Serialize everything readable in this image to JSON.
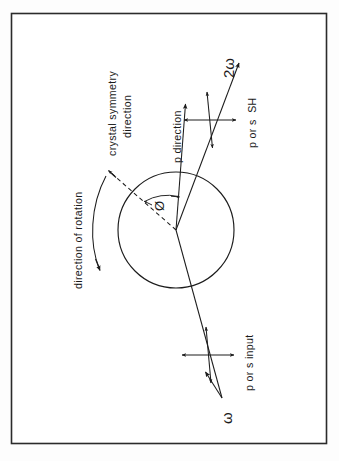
{
  "figure": {
    "border_color": "#2b2b2b",
    "ink_color": "#1c1c1c",
    "background_color": "#ffffff"
  },
  "labels": {
    "crystal_symmetry_line1": "crystal symmetry",
    "crystal_symmetry_line2": "direction",
    "p_direction": "p direction",
    "direction_of_rotation": "direction of rotation",
    "angle_symbol": "Ø",
    "output_beam_symbol": "2ω",
    "output_polarization": "p or s  SH",
    "input_beam_symbol": "ω",
    "input_polarization": "p or s input"
  },
  "geometry": {
    "frame": {
      "x": 11,
      "y": 13,
      "width": 316,
      "height": 431
    },
    "circle": {
      "cx": 176,
      "cy": 230,
      "r": 58
    },
    "beam": {
      "input_end": {
        "x": 205,
        "y": 372
      },
      "output_end": {
        "x": 240,
        "y": 62
      },
      "passes_through": {
        "x": 176,
        "y": 230
      }
    },
    "p_direction_arrow": {
      "from_x": 176,
      "from_y": 230,
      "to_x": 185,
      "to_y": 105
    },
    "symmetry_dashed": {
      "from_x": 176,
      "from_y": 230,
      "to_x": 108,
      "to_y": 170
    },
    "rotation_arc": {
      "start_x": 106,
      "start_y": 176,
      "end_x": 98,
      "end_y": 270
    },
    "polarization_cross_upper": {
      "cx": 210,
      "cy": 120
    },
    "polarization_cross_lower": {
      "cx": 208,
      "cy": 355
    }
  },
  "text_orientation": {
    "note": "all labels rotated -90 degrees (reading bottom-to-top)",
    "rotation_deg": -90
  }
}
